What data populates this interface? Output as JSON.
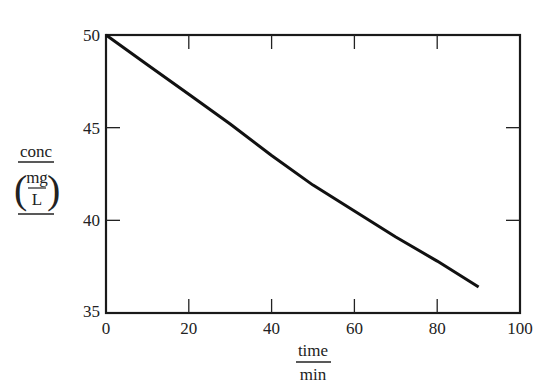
{
  "chart_data": {
    "type": "line",
    "title": "",
    "xlabel": "time / min",
    "ylabel": "conc / (mg / L)",
    "xlabel_parts": {
      "numerator": "time",
      "denominator": "min"
    },
    "ylabel_parts": {
      "numerator": "conc",
      "unit_numerator": "mg",
      "unit_denominator": "L"
    },
    "xlim": [
      0,
      100
    ],
    "ylim": [
      35,
      50
    ],
    "x_ticks": [
      0,
      20,
      40,
      60,
      80,
      100
    ],
    "y_ticks": [
      35,
      40,
      45,
      50
    ],
    "x_tick_labels": [
      "0",
      "20",
      "40",
      "60",
      "80",
      "100"
    ],
    "y_tick_labels": [
      "35",
      "40",
      "45",
      "50"
    ],
    "grid": false,
    "legend": null,
    "series": [
      {
        "name": "conc",
        "color": "#111111",
        "x": [
          0,
          10,
          20,
          30,
          40,
          50,
          60,
          70,
          80,
          90
        ],
        "y": [
          50.0,
          48.4,
          46.8,
          45.2,
          43.5,
          41.9,
          40.5,
          39.1,
          37.8,
          36.4
        ]
      }
    ]
  }
}
